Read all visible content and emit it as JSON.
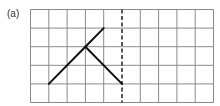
{
  "figure": {
    "label": "(a)",
    "grid": {
      "cols": 10,
      "rows": 5
    },
    "mirror_line": {
      "type": "dashed",
      "column": 5
    },
    "shape_segments": [
      {
        "from": [
          1,
          4
        ],
        "to": [
          3,
          2
        ]
      },
      {
        "from": [
          3,
          2
        ],
        "to": [
          4,
          1
        ]
      },
      {
        "from": [
          3,
          2
        ],
        "to": [
          5,
          4
        ]
      }
    ],
    "colors": {
      "grid": "#8a8a8a",
      "shape": "#111111",
      "mirror": "#222222"
    }
  }
}
